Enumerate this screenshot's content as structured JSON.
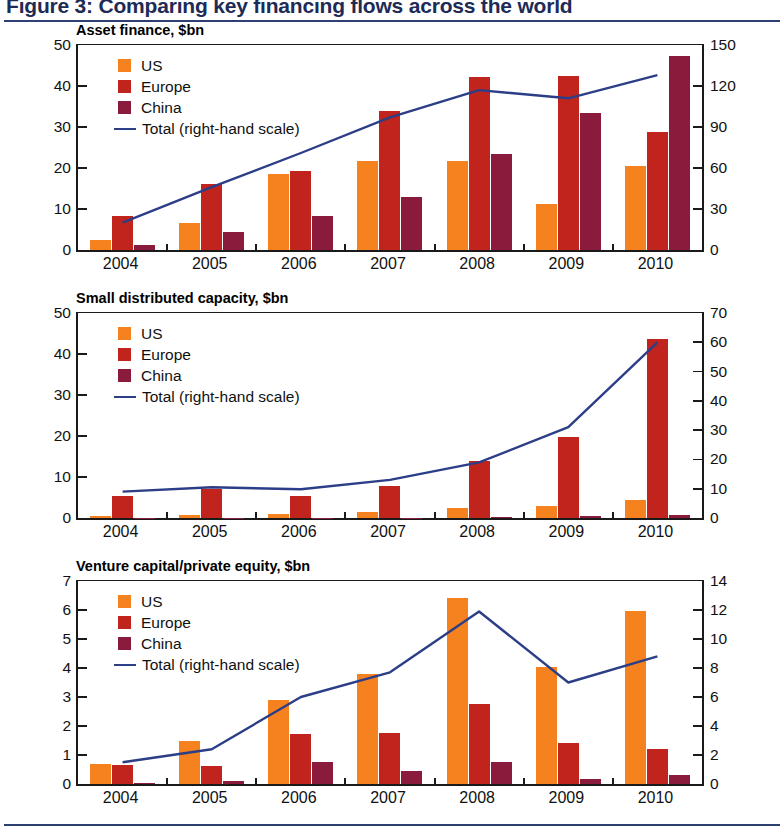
{
  "figure": {
    "title": "Figure 3: Comparing key financing flows across the world",
    "accent_color": "#2d3f73"
  },
  "legend": {
    "us_label": "US",
    "europe_label": "Europe",
    "china_label": "China",
    "total_label": "Total (right-hand scale)",
    "us_color": "#F5821F",
    "europe_color": "#C0241C",
    "china_color": "#8B1B3C",
    "total_color": "#2B3E87"
  },
  "chart_data": [
    {
      "type": "bar",
      "title": "Asset finance, $bn",
      "xlabel": "",
      "ylabel": "",
      "categories": [
        "2004",
        "2005",
        "2006",
        "2007",
        "2008",
        "2009",
        "2010"
      ],
      "ylim": [
        0,
        50
      ],
      "yticks": [
        0,
        10,
        20,
        30,
        40,
        50
      ],
      "y2lim": [
        0,
        150
      ],
      "y2ticks": [
        0,
        30,
        60,
        90,
        120,
        150
      ],
      "grid": false,
      "legend_position": "upper-left",
      "series": [
        {
          "name": "US",
          "color": "#F5821F",
          "values": [
            2.5,
            6.7,
            18.5,
            21.8,
            21.8,
            11.3,
            20.5
          ]
        },
        {
          "name": "Europe",
          "color": "#C0241C",
          "values": [
            8.3,
            16.2,
            19.2,
            34.0,
            42.3,
            42.4,
            28.8
          ]
        },
        {
          "name": "China",
          "color": "#8B1B3C",
          "values": [
            1.3,
            4.5,
            8.2,
            13.0,
            23.3,
            33.4,
            47.2
          ]
        }
      ],
      "line_series": {
        "name": "Total (right-hand scale)",
        "color": "#2B3E87",
        "axis": "right",
        "values": [
          20,
          46,
          71,
          97,
          117,
          111,
          128
        ]
      }
    },
    {
      "type": "bar",
      "title": "Small distributed capacity, $bn",
      "xlabel": "",
      "ylabel": "",
      "categories": [
        "2004",
        "2005",
        "2006",
        "2007",
        "2008",
        "2009",
        "2010"
      ],
      "ylim": [
        0,
        50
      ],
      "yticks": [
        0,
        10,
        20,
        30,
        40,
        50
      ],
      "y2lim": [
        0,
        70
      ],
      "y2ticks": [
        0,
        10,
        20,
        30,
        40,
        50,
        60,
        70
      ],
      "grid": false,
      "legend_position": "upper-left",
      "series": [
        {
          "name": "US",
          "color": "#F5821F",
          "values": [
            0.6,
            0.7,
            1.1,
            1.4,
            2.5,
            2.9,
            4.3
          ]
        },
        {
          "name": "Europe",
          "color": "#C0241C",
          "values": [
            5.3,
            7.0,
            5.3,
            7.7,
            13.8,
            19.8,
            43.7
          ]
        },
        {
          "name": "China",
          "color": "#8B1B3C",
          "values": [
            0.1,
            0.1,
            0.1,
            0.1,
            0.2,
            0.5,
            0.7
          ]
        }
      ],
      "line_series": {
        "name": "Total (right-hand scale)",
        "color": "#2B3E87",
        "axis": "right",
        "values": [
          9,
          10.5,
          9.8,
          13,
          19,
          31,
          60
        ]
      }
    },
    {
      "type": "bar",
      "title": "Venture capital/private equity, $bn",
      "xlabel": "",
      "ylabel": "",
      "categories": [
        "2004",
        "2005",
        "2006",
        "2007",
        "2008",
        "2009",
        "2010"
      ],
      "ylim": [
        0,
        7
      ],
      "yticks": [
        0,
        1,
        2,
        3,
        4,
        5,
        6,
        7
      ],
      "y2lim": [
        0,
        14
      ],
      "y2ticks": [
        0,
        2,
        4,
        6,
        8,
        10,
        12,
        14
      ],
      "grid": false,
      "legend_position": "upper-left",
      "series": [
        {
          "name": "US",
          "color": "#F5821F",
          "values": [
            0.7,
            1.5,
            2.9,
            3.8,
            6.4,
            4.05,
            5.95
          ]
        },
        {
          "name": "Europe",
          "color": "#C0241C",
          "values": [
            0.65,
            0.62,
            1.72,
            1.76,
            2.76,
            1.4,
            1.2
          ]
        },
        {
          "name": "China",
          "color": "#8B1B3C",
          "values": [
            0.02,
            0.1,
            0.76,
            0.45,
            0.76,
            0.18,
            0.3
          ]
        },
        {
          "name": "none",
          "color": "#8B1B3C",
          "values": [
            0,
            0,
            0,
            0,
            0,
            0,
            0
          ]
        }
      ],
      "line_series": {
        "name": "Total (right-hand scale)",
        "color": "#2B3E87",
        "axis": "right",
        "values": [
          1.5,
          2.4,
          6.0,
          7.7,
          11.9,
          7.0,
          8.8
        ]
      }
    }
  ]
}
